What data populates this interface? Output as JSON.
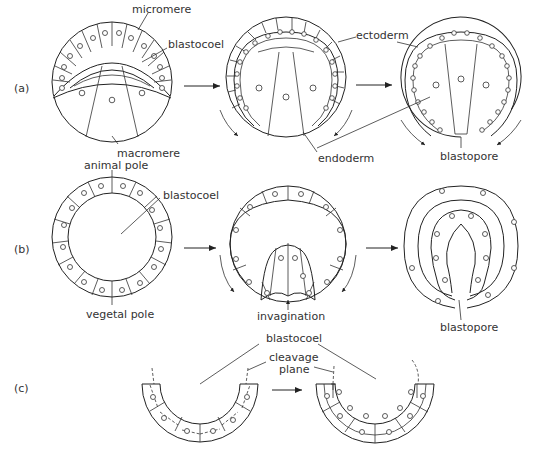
{
  "figure": {
    "panels": [
      {
        "id": "a",
        "label": "(a)"
      },
      {
        "id": "b",
        "label": "(b)"
      },
      {
        "id": "c",
        "label": "(c)"
      }
    ],
    "labels": {
      "a": {
        "micromere": "micromere",
        "blastocoel": "blastocoel",
        "macromere": "macromere",
        "ectoderm": "ectoderm",
        "endoderm": "endoderm",
        "blastopore": "blastopore"
      },
      "b": {
        "animal_pole": "animal pole",
        "blastocoel": "blastocoel",
        "vegetal_pole": "vegetal pole",
        "invagination": "invagination",
        "blastopore": "blastopore"
      },
      "c": {
        "blastocoel": "blastocoel",
        "cleavage_plane_1": "cleavage",
        "cleavage_plane_2": "plane"
      }
    }
  }
}
